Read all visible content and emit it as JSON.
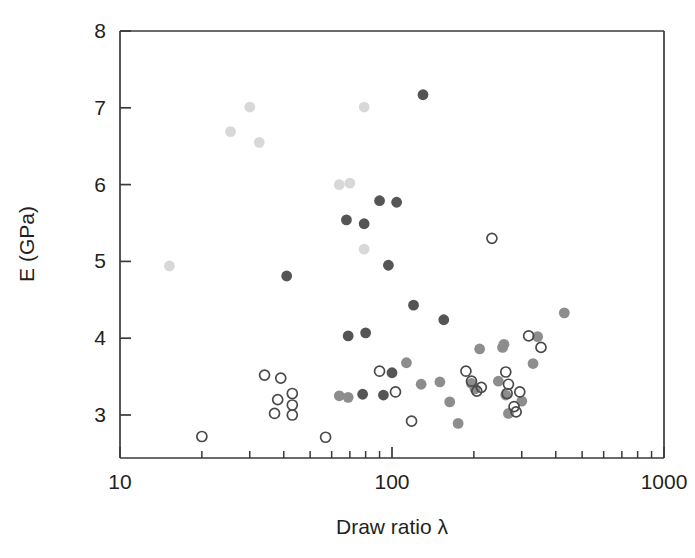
{
  "figure": {
    "background": "#ffffff",
    "plot_area": {
      "left": 120,
      "top": 31,
      "right": 664,
      "bottom": 458
    }
  },
  "chart_data": {
    "type": "scatter",
    "title": "",
    "xlabel": "Draw ratio λ",
    "ylabel": "E (GPa)",
    "xscale": "log",
    "yscale": "linear",
    "xlim": [
      10,
      1000
    ],
    "ylim": [
      2.44,
      8.0
    ],
    "xticks": [
      10,
      100,
      1000
    ],
    "xtick_labels": [
      "10",
      "100",
      "1000"
    ],
    "yticks": [
      3,
      4,
      5,
      6,
      7,
      8
    ],
    "ytick_labels": [
      "3",
      "4",
      "5",
      "6",
      "7",
      "8"
    ],
    "grid": false,
    "legend": "none",
    "minor_ticks_x": true,
    "marker_styles": {
      "open": {
        "fill": "none",
        "stroke": "#4a4a4a",
        "name": "open-circle"
      },
      "dark": {
        "fill": "#555555",
        "stroke": "none",
        "name": "dark-gray-filled-circle"
      },
      "medium": {
        "fill": "#8d8d8d",
        "stroke": "none",
        "name": "medium-gray-filled-circle"
      },
      "light": {
        "fill": "#d8d8d8",
        "stroke": "none",
        "name": "light-gray-filled-circle"
      }
    },
    "series": [
      {
        "name": "light-gray",
        "style": "light",
        "points": [
          [
            15.2,
            4.94
          ],
          [
            25.5,
            6.69
          ],
          [
            30.0,
            7.01
          ],
          [
            32.5,
            6.55
          ],
          [
            64.0,
            6.0
          ],
          [
            70.0,
            6.02
          ],
          [
            79.0,
            7.01
          ],
          [
            79.0,
            5.16
          ]
        ]
      },
      {
        "name": "dark-gray",
        "style": "dark",
        "points": [
          [
            41.0,
            4.81
          ],
          [
            68.0,
            5.54
          ],
          [
            79.0,
            5.49
          ],
          [
            90.0,
            5.79
          ],
          [
            104.0,
            5.77
          ],
          [
            97.0,
            4.95
          ],
          [
            130.0,
            7.17
          ],
          [
            120.0,
            4.43
          ],
          [
            69.0,
            4.03
          ],
          [
            80.0,
            4.07
          ],
          [
            155.0,
            4.24
          ],
          [
            78.0,
            3.27
          ],
          [
            93.0,
            3.26
          ],
          [
            100.0,
            3.55
          ]
        ]
      },
      {
        "name": "medium-gray",
        "style": "medium",
        "points": [
          [
            64.0,
            3.25
          ],
          [
            69.0,
            3.23
          ],
          [
            113.0,
            3.68
          ],
          [
            128.0,
            3.4
          ],
          [
            150.0,
            3.43
          ],
          [
            163.0,
            3.17
          ],
          [
            175.0,
            2.89
          ],
          [
            196.0,
            3.41
          ],
          [
            210.0,
            3.86
          ],
          [
            255.0,
            3.88
          ],
          [
            258.0,
            3.92
          ],
          [
            246.0,
            3.44
          ],
          [
            262.0,
            3.26
          ],
          [
            268.0,
            3.02
          ],
          [
            300.0,
            3.18
          ],
          [
            330.0,
            3.67
          ],
          [
            343.0,
            4.02
          ],
          [
            430.0,
            4.33
          ],
          [
            202.0,
            3.34
          ]
        ]
      },
      {
        "name": "open",
        "style": "open",
        "points": [
          [
            20.0,
            2.72
          ],
          [
            34.0,
            3.52
          ],
          [
            39.0,
            3.48
          ],
          [
            38.0,
            3.2
          ],
          [
            43.0,
            3.28
          ],
          [
            43.0,
            3.13
          ],
          [
            43.0,
            3.0
          ],
          [
            37.0,
            3.02
          ],
          [
            57.0,
            2.71
          ],
          [
            90.0,
            3.57
          ],
          [
            103.0,
            3.3
          ],
          [
            118.0,
            2.92
          ],
          [
            187.0,
            3.57
          ],
          [
            196.0,
            3.44
          ],
          [
            213.0,
            3.36
          ],
          [
            233.0,
            5.3
          ],
          [
            262.0,
            3.56
          ],
          [
            268.0,
            3.4
          ],
          [
            265.0,
            3.28
          ],
          [
            281.0,
            3.11
          ],
          [
            286.0,
            3.04
          ],
          [
            295.0,
            3.3
          ],
          [
            318.0,
            4.03
          ],
          [
            353.0,
            3.88
          ],
          [
            205.0,
            3.31
          ]
        ]
      }
    ]
  },
  "axis_labels": {
    "x_title": "Draw ratio λ",
    "y_title": "E (GPa)"
  }
}
